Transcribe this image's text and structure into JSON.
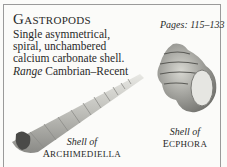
{
  "header": {
    "title_initial": "G",
    "title_rest": "ASTROPODS",
    "pages_label": "Pages: 115–133"
  },
  "description": {
    "text": "Single asymmetrical, spiral, unchambered calcium carbonate shell.",
    "range_label": "Range",
    "range_value": "Cambrian–Recent"
  },
  "figures": [
    {
      "caption_line1": "Shell of",
      "caption_initial": "A",
      "caption_rest": "RCHIMEDIELLA",
      "icon": "elongated-spiral-shell-icon"
    },
    {
      "caption_line1": "Shell of",
      "caption_initial": "E",
      "caption_rest": "CPHORA",
      "icon": "conical-spiral-shell-icon"
    }
  ]
}
